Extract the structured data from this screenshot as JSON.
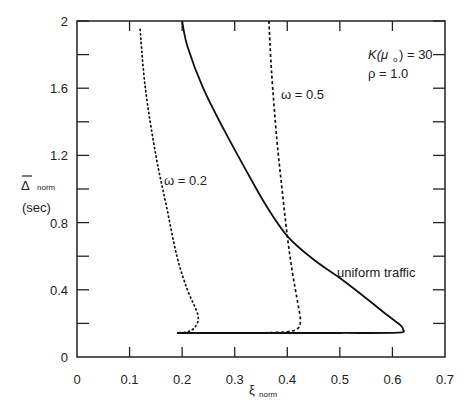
{
  "chart_data": {
    "type": "line",
    "title": "",
    "xlabel": "ξ norm",
    "ylabel": "Δ̄ norm (sec)",
    "xlim": [
      0,
      0.7
    ],
    "ylim": [
      0,
      2
    ],
    "x_ticks": [
      "0",
      "0.1",
      "0.2",
      "0.3",
      "0.4",
      "0.5",
      "0.6",
      "0.7"
    ],
    "y_ticks": [
      "0",
      "0.4",
      "0.8",
      "1.2",
      "1.6",
      "2"
    ],
    "grid": false,
    "legend": "none (curves labeled inline)",
    "annotations": [
      "K(μo) = 30",
      "ρ = 1.0",
      "ω = 0.2",
      "ω = 0.5",
      "uniform traffic"
    ],
    "series": [
      {
        "name": "uniform traffic",
        "style": "solid",
        "points": [
          [
            0.2,
            2.0
          ],
          [
            0.21,
            1.85
          ],
          [
            0.24,
            1.6
          ],
          [
            0.28,
            1.35
          ],
          [
            0.32,
            1.12
          ],
          [
            0.36,
            0.9
          ],
          [
            0.4,
            0.72
          ],
          [
            0.45,
            0.58
          ],
          [
            0.5,
            0.47
          ],
          [
            0.55,
            0.35
          ],
          [
            0.59,
            0.25
          ],
          [
            0.615,
            0.19
          ],
          [
            0.62,
            0.165
          ],
          [
            0.61,
            0.145
          ],
          [
            0.5,
            0.143
          ],
          [
            0.35,
            0.143
          ],
          [
            0.19,
            0.143
          ]
        ]
      },
      {
        "name": "ω = 0.5",
        "style": "dashed",
        "points": [
          [
            0.365,
            2.0
          ],
          [
            0.37,
            1.7
          ],
          [
            0.38,
            1.3
          ],
          [
            0.39,
            1.0
          ],
          [
            0.4,
            0.72
          ],
          [
            0.41,
            0.5
          ],
          [
            0.42,
            0.32
          ],
          [
            0.425,
            0.22
          ],
          [
            0.42,
            0.17
          ],
          [
            0.4,
            0.15
          ],
          [
            0.36,
            0.145
          ]
        ]
      },
      {
        "name": "ω = 0.2",
        "style": "dotted",
        "points": [
          [
            0.12,
            1.95
          ],
          [
            0.13,
            1.6
          ],
          [
            0.15,
            1.2
          ],
          [
            0.17,
            0.9
          ],
          [
            0.19,
            0.6
          ],
          [
            0.21,
            0.4
          ],
          [
            0.23,
            0.25
          ],
          [
            0.225,
            0.18
          ],
          [
            0.21,
            0.15
          ],
          [
            0.19,
            0.145
          ]
        ]
      }
    ]
  },
  "labels": {
    "y_title": "Δ",
    "y_title_sub": "norm",
    "y_unit": "(sec)",
    "x_title": "ξ",
    "x_title_sub": "norm",
    "k_param": "K(μ",
    "k_param_sub": "o",
    "k_param_rest": ") = 30",
    "rho_param": "ρ = 1.0",
    "omega02": "ω = 0.2",
    "omega05": "ω = 0.5",
    "uniform": "uniform traffic"
  }
}
